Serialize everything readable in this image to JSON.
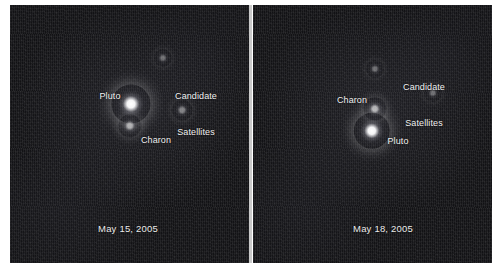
{
  "figure": {
    "width": 503,
    "height": 270,
    "background_color": "#ffffff",
    "divider_color": "#c9c9c9",
    "field_color": "#141417",
    "label_color": "#f2f2f2"
  },
  "panels": [
    {
      "id": "left-panel",
      "date_label": "May 15, 2005",
      "frame": {
        "x": 10,
        "y": 5,
        "width": 239,
        "height": 258
      },
      "date_pos": {
        "x": 128,
        "y": 223
      },
      "labels": [
        {
          "name": "pluto",
          "text": "Pluto",
          "x": 110,
          "y": 91,
          "align": "center"
        },
        {
          "name": "charon",
          "text": "Charon",
          "x": 156,
          "y": 135,
          "align": "center"
        },
        {
          "name": "candidate-satellites",
          "line1": "Candidate",
          "line2": "Satellites",
          "x": 196,
          "y": 66,
          "align": "center"
        }
      ],
      "objects": [
        {
          "name": "pluto",
          "x": 131,
          "y": 104,
          "size": 15,
          "brightness": 1.0
        },
        {
          "name": "charon",
          "x": 130,
          "y": 126,
          "size": 9,
          "brightness": 0.72
        },
        {
          "name": "candidate-satellite-upper",
          "x": 163,
          "y": 58,
          "size": 7,
          "brightness": 0.5
        },
        {
          "name": "candidate-satellite-lower",
          "x": 182,
          "y": 110,
          "size": 8,
          "brightness": 0.58
        }
      ]
    },
    {
      "id": "right-panel",
      "date_label": "May 18, 2005",
      "frame": {
        "x": 253,
        "y": 5,
        "width": 239,
        "height": 258
      },
      "date_pos": {
        "x": 383,
        "y": 223
      },
      "labels": [
        {
          "name": "charon",
          "text": "Charon",
          "x": 352,
          "y": 95,
          "align": "center"
        },
        {
          "name": "pluto",
          "text": "Pluto",
          "x": 398,
          "y": 136,
          "align": "center"
        },
        {
          "name": "candidate-satellites",
          "line1": "Candidate",
          "line2": "Satellites",
          "x": 424,
          "y": 57,
          "align": "center"
        }
      ],
      "objects": [
        {
          "name": "pluto",
          "x": 372,
          "y": 131,
          "size": 14,
          "brightness": 1.0
        },
        {
          "name": "charon",
          "x": 375,
          "y": 109,
          "size": 9,
          "brightness": 0.75
        },
        {
          "name": "candidate-satellite-upper",
          "x": 375,
          "y": 69,
          "size": 7,
          "brightness": 0.5
        },
        {
          "name": "candidate-satellite-lower",
          "x": 433,
          "y": 93,
          "size": 7,
          "brightness": 0.5
        }
      ]
    }
  ],
  "divider": {
    "x": 249,
    "y": 5,
    "width": 3,
    "height": 258
  }
}
